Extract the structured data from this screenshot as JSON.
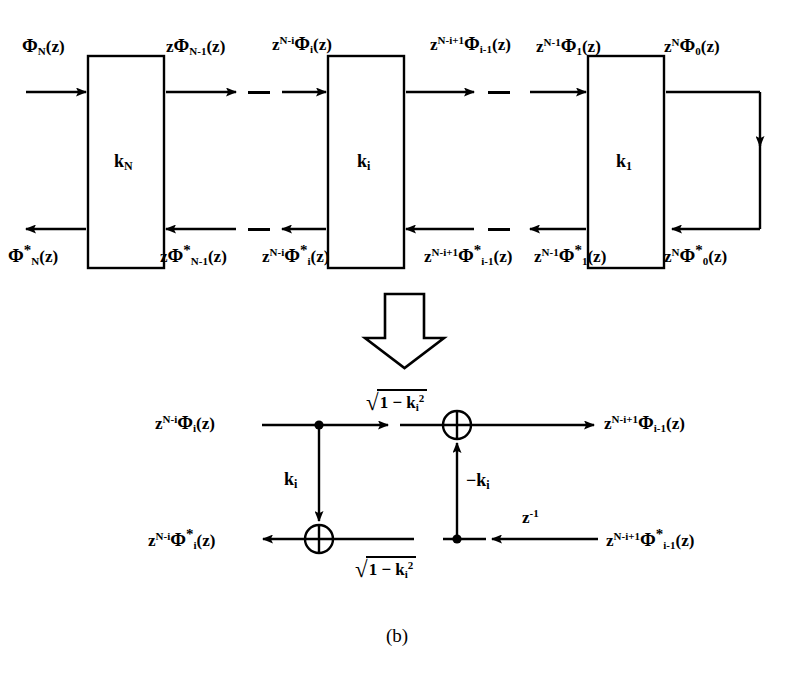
{
  "figure": {
    "caption": "(b)",
    "transform_arrow": "downward-block-arrow"
  },
  "top_diagram": {
    "stages": [
      {
        "id": "stage-N",
        "box_label_base": "k",
        "box_label_sub": "N",
        "forward_in": {
          "z_coef": "",
          "z_exp": "",
          "phi": "Φ",
          "phi_sub": "N",
          "arg": "(z)",
          "star": false
        },
        "forward_out": {
          "z_coef": "z",
          "z_exp": "",
          "phi": "Φ",
          "phi_sub": "N-1",
          "arg": "(z)",
          "star": false
        },
        "backward_out": {
          "z_coef": "",
          "z_exp": "",
          "phi": "Φ",
          "phi_sub": "N",
          "arg": "(z)",
          "star": true
        },
        "backward_in": {
          "z_coef": "z",
          "z_exp": "",
          "phi": "Φ",
          "phi_sub": "N-1",
          "arg": "(z)",
          "star": true
        }
      },
      {
        "id": "stage-i",
        "box_label_base": "k",
        "box_label_sub": "i",
        "forward_in": {
          "z_coef": "z",
          "z_exp": "N-i",
          "phi": "Φ",
          "phi_sub": "i",
          "arg": "(z)",
          "star": false
        },
        "forward_out": {
          "z_coef": "z",
          "z_exp": "N-i+1",
          "phi": "Φ",
          "phi_sub": "i-1",
          "arg": "(z)",
          "star": false
        },
        "backward_out": {
          "z_coef": "z",
          "z_exp": "N-i",
          "phi": "Φ",
          "phi_sub": "i",
          "arg": "(z)",
          "star": true
        },
        "backward_in": {
          "z_coef": "z",
          "z_exp": "N-i+1",
          "phi": "Φ",
          "phi_sub": "i-1",
          "arg": "(z)",
          "star": true
        }
      },
      {
        "id": "stage-1",
        "box_label_base": "k",
        "box_label_sub": "1",
        "forward_in": {
          "z_coef": "z",
          "z_exp": "N-1",
          "phi": "Φ",
          "phi_sub": "1",
          "arg": "(z)",
          "star": false
        },
        "forward_out": {
          "z_coef": "z",
          "z_exp": "N",
          "phi": "Φ",
          "phi_sub": "0",
          "arg": "(z)",
          "star": false
        },
        "backward_out": {
          "z_coef": "z",
          "z_exp": "N-1",
          "phi": "Φ",
          "phi_sub": "1",
          "arg": "(z)",
          "star": true
        },
        "backward_in": {
          "z_coef": "z",
          "z_exp": "N",
          "phi": "Φ",
          "phi_sub": "0",
          "arg": "(z)",
          "star": true
        }
      }
    ],
    "ellipsis_marks": 4
  },
  "bottom_diagram": {
    "top_left_signal": {
      "z_coef": "z",
      "z_exp": "N-i",
      "phi": "Φ",
      "phi_sub": "i",
      "arg": "(z)",
      "star": false
    },
    "top_right_signal": {
      "z_coef": "z",
      "z_exp": "N-i+1",
      "phi": "Φ",
      "phi_sub": "i-1",
      "arg": "(z)",
      "star": false
    },
    "bot_left_signal": {
      "z_coef": "z",
      "z_exp": "N-i",
      "phi": "Φ",
      "phi_sub": "i",
      "arg": "(z)",
      "star": true
    },
    "bot_right_signal": {
      "z_coef": "z",
      "z_exp": "N-i+1",
      "phi": "Φ",
      "phi_sub": "i-1",
      "arg": "(z)",
      "star": true
    },
    "gain_top": {
      "radical": "√",
      "expr": "1 − k",
      "sub": "i",
      "sup": "2"
    },
    "gain_bottom": {
      "radical": "√",
      "expr": "1 − k",
      "sub": "i",
      "sup": "2"
    },
    "gain_down": {
      "base": "k",
      "sub": "i"
    },
    "gain_up": {
      "base": "−k",
      "sub": "i"
    },
    "delay": {
      "base": "z",
      "exp": "-1"
    },
    "adder_symbol": "⊕"
  }
}
